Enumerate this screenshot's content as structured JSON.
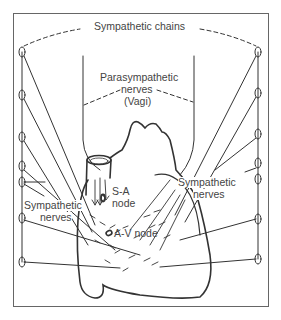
{
  "diagram": {
    "labels": {
      "sympathetic_chains": "Sympathetic chains",
      "parasympathetic_line1": "Parasympathetic",
      "parasympathetic_line2": "nerves",
      "parasympathetic_line3": "(Vagi)",
      "sa_node_line1": "S-A",
      "sa_node_line2": "node",
      "av_node": "A-V node",
      "sympathetic_left_line1": "Sympathetic",
      "sympathetic_left_line2": "nerves",
      "sympathetic_right_line1": "Sympathetic",
      "sympathetic_right_line2": "nerves"
    },
    "left_chain_ganglia_y": [
      52,
      95,
      137,
      166,
      182,
      218,
      262
    ],
    "right_chain_ganglia_y": [
      52,
      93,
      134,
      163,
      179,
      219,
      259
    ],
    "colors": {
      "line": "#333333",
      "text": "#444444",
      "frame": "#666666"
    }
  }
}
